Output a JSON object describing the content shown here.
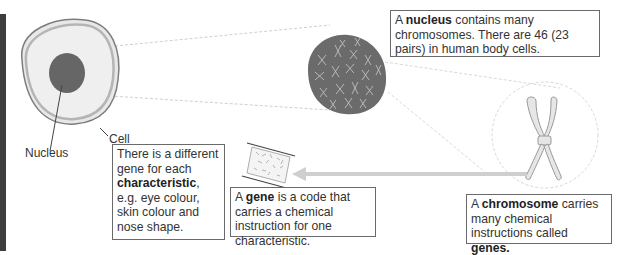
{
  "labels": {
    "cell": "Cell",
    "nucleus": "Nucleus"
  },
  "boxes": {
    "nucleus_info": {
      "prefix": "A ",
      "bold": "nucleus",
      "suffix": " contains many chromosomes. There are 46 (23 pairs) in human body cells."
    },
    "characteristic_info": {
      "prefix": "There is a different gene for each ",
      "bold": "characteristic",
      "suffix": ", e.g. eye colour, skin colour and nose shape."
    },
    "gene_info": {
      "prefix": "A ",
      "bold": "gene",
      "suffix": " is a code that carries a chemical instruction for one characteristic."
    },
    "chromosome_info": {
      "prefix": "A ",
      "bold": "chromosome",
      "middle": " carries many chemical instructions called ",
      "bold2": "genes."
    }
  },
  "colors": {
    "cell_fill": "#e9e9e9",
    "cell_membrane": "#9a9a9a",
    "nucleus_fill": "#666666",
    "nucleus_large_fill": "#6b6b6b",
    "chromosome_fill": "#e6e6e6",
    "arrow": "#cfcfcf",
    "box_border": "#6a6a6a",
    "left_bar": "#3d3d3d"
  }
}
